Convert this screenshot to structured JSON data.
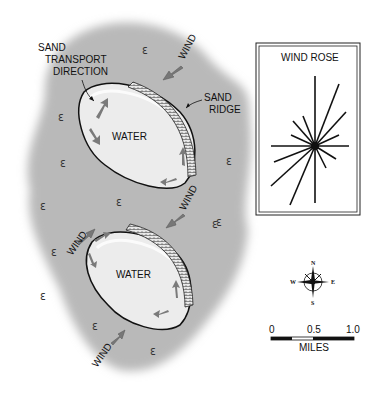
{
  "diagram": {
    "labels": {
      "sand_transport": [
        "SAND",
        "TRANSPORT",
        "DIRECTION"
      ],
      "sand_ridge": [
        "SAND",
        "RIDGE"
      ],
      "water_upper": "WATER",
      "water_lower": "WATER",
      "wind": "WIND"
    },
    "wind_rose": {
      "title": "WIND ROSE"
    },
    "compass": {
      "n": "N",
      "s": "S",
      "e": "E",
      "w": "W"
    },
    "scale_bar": {
      "ticks": [
        "0",
        "0.5",
        "1.0"
      ],
      "unit": "MILES"
    },
    "colors": {
      "land": "#b9b9b9",
      "water": "#ececec",
      "arrow": "#7a7a7a",
      "ink": "#111111"
    }
  }
}
